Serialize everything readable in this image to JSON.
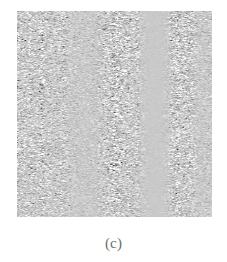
{
  "figure": {
    "caption": "(c)",
    "panel_label": "c",
    "background_color": "#ffffff",
    "image": {
      "alt_name": "grayscale-residual-matrix",
      "mid_gray": "#c9c9c9",
      "dark_extreme": "#1a1a1a",
      "light_extreme": "#ffffff",
      "left_px": 17,
      "top_px": 11,
      "width_px": 195,
      "height_px": 206
    }
  },
  "chart_data": {
    "type": "heatmap",
    "title": "",
    "subtitle": "",
    "xlabel": "",
    "ylabel": "",
    "annotations": [
      "(c)"
    ],
    "legend": [],
    "grid": false,
    "colormap": "grayscale",
    "value_range": [
      -1,
      1
    ],
    "midpoint_value": 0,
    "n_columns": 195,
    "n_rows": 206,
    "column_activity_profile": {
      "x_label": "column index (px from left edge of image)",
      "y_label": "local contrast amplitude (0 = flat mid-gray, 1 = full black/white range)",
      "x": [
        0,
        8,
        16,
        24,
        32,
        40,
        48,
        56,
        64,
        72,
        80,
        88,
        96,
        104,
        112,
        120,
        128,
        136,
        144,
        152,
        160,
        168,
        176,
        184,
        192
      ],
      "values": [
        0.62,
        0.78,
        0.74,
        0.82,
        0.7,
        0.66,
        0.58,
        0.44,
        0.3,
        0.26,
        0.48,
        0.8,
        0.92,
        0.88,
        0.84,
        0.62,
        0.14,
        0.06,
        0.08,
        0.52,
        0.76,
        0.7,
        0.58,
        0.4,
        0.34
      ]
    },
    "bands": [
      {
        "name": "band-1-active",
        "x_start": 0,
        "x_end": 46,
        "activity": 0.75
      },
      {
        "name": "band-2-quiet",
        "x_start": 46,
        "x_end": 70,
        "activity": 0.3
      },
      {
        "name": "band-3-active",
        "x_start": 70,
        "x_end": 122,
        "activity": 0.88
      },
      {
        "name": "band-4-blank",
        "x_start": 122,
        "x_end": 146,
        "activity": 0.07
      },
      {
        "name": "band-5-active",
        "x_start": 146,
        "x_end": 180,
        "activity": 0.72
      },
      {
        "name": "band-6-quiet",
        "x_start": 180,
        "x_end": 195,
        "activity": 0.36
      }
    ],
    "row_activity_profile": {
      "x_label": "row index (px from top edge of image)",
      "y_label": "local contrast amplitude",
      "x": [
        0,
        16,
        32,
        48,
        64,
        80,
        96,
        112,
        128,
        144,
        160,
        176,
        192,
        205
      ],
      "values": [
        0.7,
        0.82,
        0.8,
        0.74,
        0.78,
        0.72,
        0.76,
        0.7,
        0.74,
        0.8,
        0.72,
        0.66,
        0.74,
        0.62
      ]
    }
  }
}
